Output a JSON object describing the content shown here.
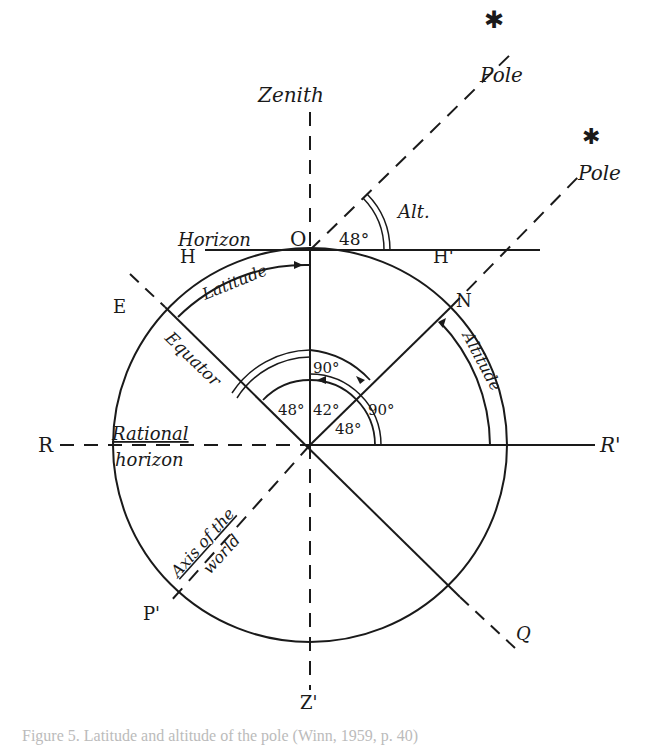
{
  "diagram": {
    "labels": {
      "zenith": "Zenith",
      "pole_upper": "Pole",
      "pole_lower": "Pole",
      "star": "✱",
      "alt_short": "Alt.",
      "horizon": "Horizon",
      "origin": "O",
      "h_left": "H",
      "h_right": "H'",
      "latitude": "Latitude",
      "e_point": "E",
      "n_point": "N",
      "equator": "Equator",
      "altitude": "Altitude",
      "angle_top": "48°",
      "angle_90_upper": "90°",
      "angle_48_left": "48°",
      "angle_42": "42°",
      "angle_90_right": "90°",
      "angle_48_lower": "48°",
      "r_left": "R",
      "r_right": "R'",
      "rational_1": "Rational",
      "rational_2": "horizon",
      "axis_1": "Axis of the",
      "axis_2": "world",
      "p_prime": "P'",
      "q_point": "Q",
      "z_prime": "Z'"
    },
    "caption": "Figure 5. Latitude and altitude of the pole (Winn, 1959, p. 40)"
  }
}
